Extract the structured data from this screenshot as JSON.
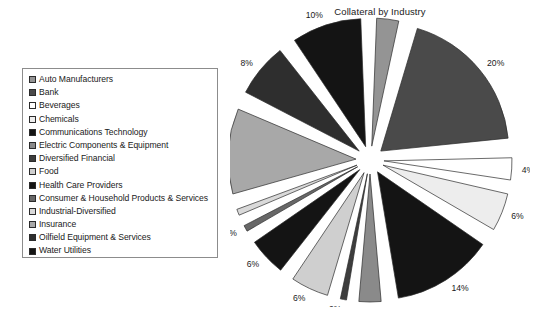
{
  "chart": {
    "title": "Collateral by Industry"
  },
  "legend": {
    "name": "chart-legend",
    "items": [
      {
        "label": "Auto Manufacturers",
        "color": "#949494"
      },
      {
        "label": "Bank",
        "color": "#4a4a4a"
      },
      {
        "label": "Beverages",
        "color": "#ffffff"
      },
      {
        "label": "Chemicals",
        "color": "#ededed"
      },
      {
        "label": "Communications Technology",
        "color": "#141414"
      },
      {
        "label": "Electric Components & Equipment",
        "color": "#8a8a8a"
      },
      {
        "label": "Diversified Financial",
        "color": "#3d3d3d"
      },
      {
        "label": "Food",
        "color": "#cfcfcf"
      },
      {
        "label": "Health Care Providers",
        "color": "#141414"
      },
      {
        "label": "Consumer & Household Products & Services",
        "color": "#676767"
      },
      {
        "label": "Industrial-Diversified",
        "color": "#d9d9d9"
      },
      {
        "label": "Insurance",
        "color": "#a8a8a8"
      },
      {
        "label": "Oilfield Equipment & Services",
        "color": "#2e2e2e"
      },
      {
        "label": "Water Utilities",
        "color": "#141414"
      }
    ]
  },
  "chart_data": {
    "type": "pie",
    "title": "Collateral by Industry",
    "xlabel": "",
    "ylabel": "",
    "exploded": true,
    "legend_position": "left",
    "units": "percent",
    "value_label_format": "{value}%",
    "categories": [
      "Auto Manufacturers",
      "Bank",
      "Beverages",
      "Chemicals",
      "Communications Technology",
      "Electric Components & Equipment",
      "Diversified Financial",
      "Food",
      "Health Care Providers",
      "Consumer & Household Products & Services",
      "Industrial-Diversified",
      "Insurance",
      "Oilfield Equipment & Services",
      "Water Utilities"
    ],
    "values": [
      4,
      20,
      4,
      6,
      14,
      4,
      2,
      6,
      6,
      2,
      2,
      12,
      8,
      10
    ],
    "colors": [
      "#949494",
      "#4a4a4a",
      "#ffffff",
      "#ededed",
      "#141414",
      "#8a8a8a",
      "#3d3d3d",
      "#cfcfcf",
      "#141414",
      "#676767",
      "#d9d9d9",
      "#a8a8a8",
      "#2e2e2e",
      "#141414"
    ],
    "slice_labels": [
      "4%",
      "20%",
      "4%",
      "6%",
      "14%",
      "4%",
      "2%",
      "6%",
      "6%",
      "2%",
      "2%",
      "12%",
      "8%",
      "10%"
    ],
    "total": 100,
    "start_angle_deg": 0,
    "direction": "clockwise"
  }
}
